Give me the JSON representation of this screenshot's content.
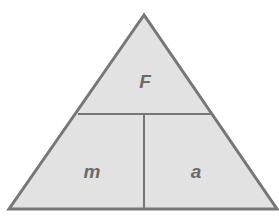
{
  "diagram": {
    "title": "",
    "top_label": "F",
    "bottom_left_label": "m",
    "bottom_right_label": "a",
    "colors": {
      "fill": "#e2e2e2",
      "stroke": "#777777",
      "text": "#6b6b6b"
    }
  }
}
